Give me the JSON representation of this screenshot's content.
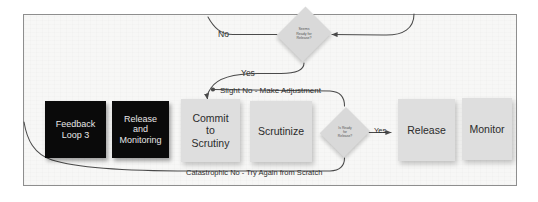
{
  "diagram": {
    "frame_background": "#f7f7f6",
    "frame_border_color": "#8e8e8e",
    "connector_color": "#4a4a4a",
    "ghost_text": "SCANNED PAGE BACKGROUND",
    "nodes": [
      {
        "id": "feedback-loop-3",
        "label": "Feedback\nLoop 3",
        "shape": "rect",
        "style": "dark",
        "fill": "#0a0a0a",
        "text_color": "#e8e8e8",
        "x": 45,
        "y": 101,
        "w": 61,
        "h": 57
      },
      {
        "id": "release-and-monitoring",
        "label": "Release\nand\nMonitoring",
        "shape": "rect",
        "style": "dark",
        "fill": "#0a0a0a",
        "text_color": "#e8e8e8",
        "x": 112,
        "y": 101,
        "w": 57,
        "h": 57
      },
      {
        "id": "commit-to-scrutiny",
        "label": "Commit\nto\nScrutiny",
        "shape": "rect",
        "style": "light",
        "fill": "#dedede",
        "text_color": "#2b2b2b",
        "x": 181,
        "y": 99,
        "w": 59,
        "h": 63
      },
      {
        "id": "scrutinize",
        "label": "Scrutinize",
        "shape": "rect",
        "style": "light",
        "fill": "#dedede",
        "text_color": "#2b2b2b",
        "x": 250,
        "y": 101,
        "w": 62,
        "h": 61
      },
      {
        "id": "release",
        "label": "Release",
        "shape": "rect",
        "style": "light",
        "fill": "#dedede",
        "text_color": "#2b2b2b",
        "x": 398,
        "y": 99,
        "w": 57,
        "h": 62
      },
      {
        "id": "monitor",
        "label": "Monitor",
        "shape": "rect",
        "style": "light",
        "fill": "#dedede",
        "text_color": "#2b2b2b",
        "x": 462,
        "y": 98,
        "w": 50,
        "h": 62
      }
    ],
    "decisions": [
      {
        "id": "seems-ready-for-release",
        "label": "Seems\nReady for\nRelease?",
        "shape": "diamond",
        "fill": "#d9d9d9",
        "text_color": "#565656",
        "x": 278,
        "y": 5,
        "w": 52,
        "h": 58,
        "font_size": "3.6px"
      },
      {
        "id": "is-ready-for-release",
        "label": "Is Ready\nfor\nRelease?",
        "shape": "diamond",
        "fill": "#d9d9d9",
        "text_color": "#565656",
        "x": 321,
        "y": 106,
        "w": 48,
        "h": 52,
        "font_size": "3.4px"
      }
    ],
    "edge_labels": [
      {
        "id": "no-label",
        "text": "No",
        "x": 218,
        "y": 29,
        "size": 8.5
      },
      {
        "id": "yes-label-top",
        "text": "Yes",
        "x": 241,
        "y": 68,
        "size": 8.5
      },
      {
        "id": "slight-no-label",
        "text": "Slight No - Make Adjustment",
        "x": 220,
        "y": 86,
        "size": 8
      },
      {
        "id": "yes-label-release",
        "text": "Yes",
        "x": 374,
        "y": 126,
        "size": 7.5
      },
      {
        "id": "catastrophic-label",
        "text": "Catastrophic No - Try Again from Scratch",
        "x": 186,
        "y": 168,
        "size": 7.5
      }
    ]
  }
}
